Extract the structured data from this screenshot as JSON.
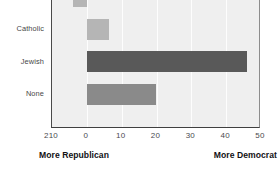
{
  "chart_data": {
    "type": "bar",
    "orientation": "horizontal",
    "title": "",
    "subtitle": "",
    "xlabel": "",
    "ylabel": "",
    "categories": [
      "Protestant",
      "Catholic",
      "Jewish",
      "None"
    ],
    "values": [
      -4,
      6.5,
      46,
      20
    ],
    "series": [
      {
        "name": "Partisan lean",
        "values": [
          -4,
          6.5,
          46,
          20
        ]
      }
    ],
    "bar_colors": [
      "#b5b5b5",
      "#b5b5b5",
      "#595959",
      "#8a8a8a"
    ],
    "xlim": [
      -10,
      50
    ],
    "xticks": [
      -10,
      0,
      10,
      20,
      30,
      40,
      50
    ],
    "xticklabels": [
      "210",
      "0",
      "10",
      "20",
      "30",
      "40",
      "50"
    ],
    "grid": "vertical",
    "gridline_color": "#fdfdfd",
    "plot_background": "#efefef",
    "legend": "none",
    "annotations": [
      {
        "text": "More Republican",
        "position": "bottom-left"
      },
      {
        "text": "More Democrat",
        "position": "bottom-right"
      }
    ]
  },
  "axis": {
    "tick_labels": [
      "210",
      "0",
      "10",
      "20",
      "30",
      "40",
      "50"
    ]
  },
  "categories": {
    "labels": [
      "Protestant",
      "Catholic",
      "Jewish",
      "None"
    ]
  },
  "annotations": {
    "left": "More Republican",
    "right": "More Democrat"
  },
  "colors": {
    "bar_light": "#b5b5b5",
    "bar_medium": "#8a8a8a",
    "bar_dark": "#595959",
    "plot_bg": "#efefef",
    "gridline": "#fdfdfd",
    "axis": "#3f3f3f",
    "text": "#2b2b2b"
  }
}
